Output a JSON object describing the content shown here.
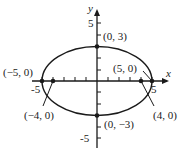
{
  "figure": {
    "type": "ellipse-graph",
    "equation_semantics": "x^2/25 + y^2/9 = 1",
    "axes": {
      "x_label": "x",
      "y_label": "y",
      "x_ticks": [
        "-5",
        "5"
      ],
      "y_ticks": [
        "5",
        "-5"
      ],
      "x_range": [
        -5,
        5
      ],
      "y_range": [
        -5,
        5
      ]
    },
    "ellipse": {
      "a": 5,
      "b": 3,
      "center": [
        0,
        0
      ]
    },
    "points": [
      {
        "label": "(0, 3)",
        "x": 0,
        "y": 3,
        "kind": "vertex"
      },
      {
        "label": "(0, −3)",
        "x": 0,
        "y": -3,
        "kind": "vertex"
      },
      {
        "label": "(−5, 0)",
        "x": -5,
        "y": 0,
        "kind": "vertex"
      },
      {
        "label": "(5, 0)",
        "x": 5,
        "y": 0,
        "kind": "vertex"
      },
      {
        "label": "(−4, 0)",
        "x": -4,
        "y": 0,
        "kind": "focus"
      },
      {
        "label": "(4, 0)",
        "x": 4,
        "y": 0,
        "kind": "focus"
      }
    ]
  }
}
